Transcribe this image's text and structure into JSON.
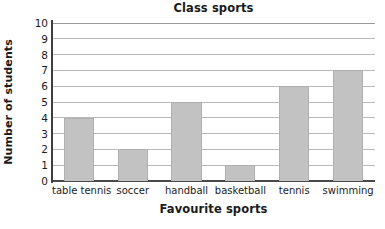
{
  "chart_data": {
    "type": "bar",
    "title": "Class sports",
    "xlabel": "Favourite sports",
    "ylabel": "Number of students",
    "categories": [
      "table tennis",
      "soccer",
      "handball",
      "basketball",
      "tennis",
      "swimming"
    ],
    "values": [
      4,
      2,
      5,
      1,
      6,
      7
    ],
    "ylim": [
      0,
      10
    ],
    "ytick_labels": [
      "0",
      "1",
      "2",
      "3",
      "4",
      "5",
      "6",
      "7",
      "8",
      "9",
      "10"
    ],
    "ytick_values": [
      0,
      1,
      2,
      3,
      4,
      5,
      6,
      7,
      8,
      9,
      10
    ],
    "grid": "horizontal",
    "legend": "none",
    "colors": {
      "bar_fill": "#c2c2c2",
      "bar_edge": "#b0b0b0",
      "gridline": "#b9b9b9",
      "axis": "#3f3f3f",
      "background": "#ffffff",
      "text": "#1a1a1a"
    }
  }
}
